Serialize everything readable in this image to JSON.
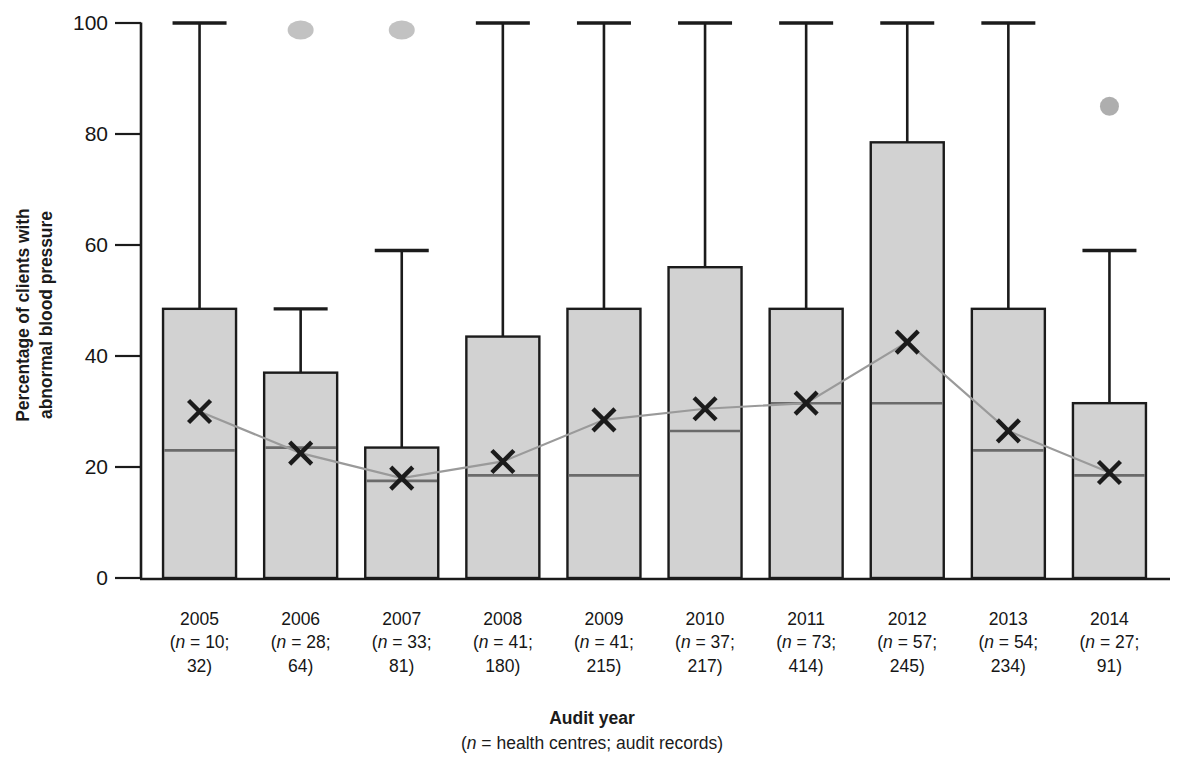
{
  "axes": {
    "ylabel": "Percentage of clients with\nabnormal blood pressure",
    "xtitle": "Audit year",
    "xsubtitle_pre": "(",
    "xsubtitle_italic": "n",
    "xsubtitle_post": " = health centres; audit records)",
    "yticks": [
      "0",
      "20",
      "40",
      "60",
      "80",
      "100"
    ]
  },
  "xcats": [
    {
      "year": "2005",
      "n_line": " = 10;",
      "n_line2": "32)"
    },
    {
      "year": "2006",
      "n_line": " = 28;",
      "n_line2": "64)"
    },
    {
      "year": "2007",
      "n_line": " = 33;",
      "n_line2": "81)"
    },
    {
      "year": "2008",
      "n_line": " = 41;",
      "n_line2": "180)"
    },
    {
      "year": "2009",
      "n_line": " = 41;",
      "n_line2": "215)"
    },
    {
      "year": "2010",
      "n_line": " = 37;",
      "n_line2": "217)"
    },
    {
      "year": "2011",
      "n_line": " = 73;",
      "n_line2": "414)"
    },
    {
      "year": "2012",
      "n_line": " = 57;",
      "n_line2": "245)"
    },
    {
      "year": "2013",
      "n_line": " = 54;",
      "n_line2": "234)"
    },
    {
      "year": "2014",
      "n_line": " = 27;",
      "n_line2": "91)"
    }
  ],
  "colors": {
    "bar_fill": "#d2d2d2",
    "bar_stroke": "#1b1b1b",
    "median": "#6b6b6b",
    "mean_line": "#9a9a9a",
    "outlier": "#9c9c9c",
    "axis": "#1b1b1b"
  },
  "chart_data": {
    "type": "bar",
    "title": "",
    "xlabel": "Audit year (n = health centres; audit records)",
    "ylabel": "Percentage of clients with abnormal blood pressure",
    "ylim": [
      0,
      100
    ],
    "yticks": [
      0,
      20,
      40,
      60,
      80,
      100
    ],
    "grid": false,
    "legend": "none",
    "categories": [
      "2005",
      "2006",
      "2007",
      "2008",
      "2009",
      "2010",
      "2011",
      "2012",
      "2013",
      "2014"
    ],
    "n_health_centres": [
      10,
      28,
      33,
      41,
      41,
      37,
      73,
      57,
      54,
      27
    ],
    "n_audit_records": [
      32,
      64,
      81,
      180,
      215,
      217,
      414,
      245,
      234,
      91
    ],
    "series": [
      {
        "name": "Upper quartile (bar top)",
        "values": [
          48.5,
          37,
          23.5,
          43.5,
          48.5,
          56,
          48.5,
          78.5,
          48.5,
          31.5
        ]
      },
      {
        "name": "Median",
        "values": [
          23,
          23.5,
          17.5,
          18.5,
          18.5,
          26.5,
          31.5,
          31.5,
          23,
          18.5
        ]
      },
      {
        "name": "Mean",
        "values": [
          30,
          22.5,
          18,
          21,
          28.5,
          30.5,
          31.5,
          42.5,
          26.5,
          19
        ]
      },
      {
        "name": "Maximum (whisker top)",
        "values": [
          100,
          48.5,
          59,
          100,
          100,
          100,
          100,
          100,
          100,
          59
        ]
      }
    ],
    "outliers": [
      {
        "category": "2006",
        "value": 100
      },
      {
        "category": "2007",
        "value": 100
      },
      {
        "category": "2014",
        "value": 85
      }
    ]
  }
}
